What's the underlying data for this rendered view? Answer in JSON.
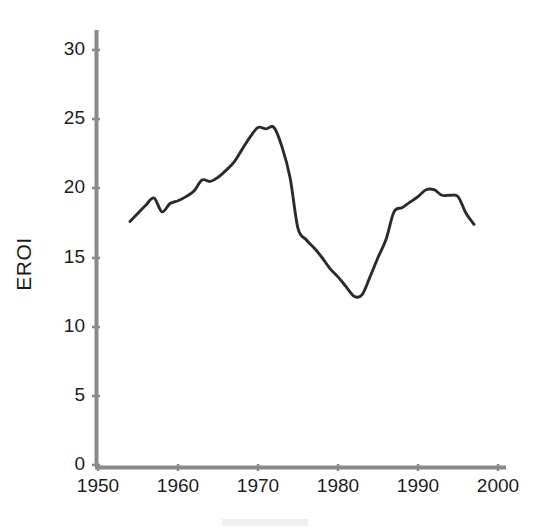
{
  "chart_data": {
    "type": "line",
    "title": "",
    "xlabel": "",
    "ylabel": "EROI",
    "xlim": [
      1950,
      2000
    ],
    "ylim": [
      0,
      31
    ],
    "grid": false,
    "legend": null,
    "xticks": [
      1950,
      1960,
      1970,
      1980,
      1990,
      2000
    ],
    "yticks": [
      0,
      5,
      10,
      15,
      20,
      25,
      30
    ],
    "xtick_labels": [
      "1950",
      "1960",
      "1970",
      "1980",
      "1990",
      "2000"
    ],
    "ytick_labels": [
      "0",
      "5",
      "10",
      "15",
      "20",
      "25",
      "30"
    ],
    "series": [
      {
        "name": "EROI",
        "color": "#2b2b2b",
        "x": [
          1954,
          1955,
          1956,
          1957,
          1958,
          1959,
          1960,
          1961,
          1962,
          1963,
          1964,
          1965,
          1966,
          1967,
          1968,
          1969,
          1970,
          1971,
          1972,
          1973,
          1974,
          1975,
          1976,
          1977,
          1978,
          1979,
          1980,
          1981,
          1982,
          1983,
          1984,
          1985,
          1986,
          1987,
          1988,
          1989,
          1990,
          1991,
          1992,
          1993,
          1994,
          1995,
          1996,
          1997
        ],
        "values": [
          17.6,
          18.2,
          18.8,
          19.3,
          18.3,
          18.9,
          19.1,
          19.4,
          19.8,
          20.6,
          20.5,
          20.8,
          21.3,
          21.9,
          22.8,
          23.7,
          24.4,
          24.3,
          24.4,
          23.0,
          20.8,
          17.1,
          16.3,
          15.7,
          15.0,
          14.2,
          13.6,
          12.9,
          12.2,
          12.3,
          13.6,
          15.0,
          16.3,
          18.3,
          18.6,
          19.0,
          19.4,
          19.9,
          19.9,
          19.5,
          19.5,
          19.4,
          18.2,
          17.4
        ]
      }
    ],
    "annotations": {
      "peak_year": 1970,
      "peak_value": 24.5,
      "trough_year": 1982,
      "trough_value": 12.2,
      "start_year": 1954,
      "start_value": 17.6,
      "end_year": 1997,
      "end_value": 17.4
    },
    "axis_color": "#8a8a8a",
    "line_color": "#2b2b2b",
    "background_color": "#ffffff"
  }
}
